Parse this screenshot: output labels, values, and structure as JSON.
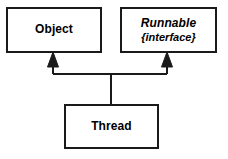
{
  "diagram": {
    "type": "uml-class-diagram",
    "background_color": "#ffffff",
    "line_color": "#1a1a1a",
    "text_color": "#000000",
    "classes": [
      {
        "id": "object",
        "name": "Object",
        "style": "plain",
        "stereotype": null
      },
      {
        "id": "runnable",
        "name": "Runnable",
        "style": "italic",
        "stereotype": "{interface}"
      },
      {
        "id": "thread",
        "name": "Thread",
        "style": "plain",
        "stereotype": null
      }
    ],
    "relationships": [
      {
        "from": "thread",
        "to": "object",
        "kind": "generalization",
        "arrowhead": "closed-triangle"
      },
      {
        "from": "thread",
        "to": "runnable",
        "kind": "realization",
        "arrowhead": "closed-triangle"
      }
    ]
  }
}
